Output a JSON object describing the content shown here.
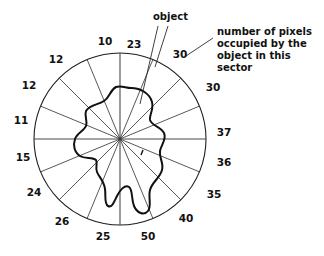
{
  "figure": {
    "title": "",
    "center": {
      "x": 120,
      "y": 139
    },
    "radius": 86,
    "sector_count": 16,
    "object_label": "object",
    "callout": {
      "line1": "number of pixels",
      "line2": "occupied by the",
      "line3": "object in this",
      "line4": "sector"
    }
  },
  "chart_data": {
    "type": "bar",
    "title": "",
    "xlabel": "",
    "ylabel": "number of pixels occupied by the object in this sector",
    "ylim": [
      0,
      50
    ],
    "grid": false,
    "legend": "none",
    "categories": [
      "0-22.5°",
      "22.5-45°",
      "45-67.5°",
      "67.5-90°",
      "90-112.5°",
      "112.5-135°",
      "135-157.5°",
      "157.5-180°",
      "180-202.5°",
      "202.5-225°",
      "225-247.5°",
      "247.5-270°",
      "270-292.5°",
      "292.5-315°",
      "315-337.5°",
      "337.5-360°"
    ],
    "values": [
      23,
      30,
      30,
      37,
      36,
      35,
      40,
      50,
      25,
      26,
      24,
      15,
      11,
      12,
      12,
      10
    ],
    "annotations": [
      "object",
      "number of pixels occupied by the object in this sector"
    ]
  },
  "sectors": [
    {
      "index": 0,
      "value": "23",
      "label_x": 134,
      "label_y": 48,
      "anchor": "middle"
    },
    {
      "index": 1,
      "value": "30",
      "label_x": 180,
      "label_y": 58,
      "anchor": "middle"
    },
    {
      "index": 2,
      "value": "30",
      "label_x": 213,
      "label_y": 91,
      "anchor": "middle"
    },
    {
      "index": 3,
      "value": "37",
      "label_x": 224,
      "label_y": 136,
      "anchor": "middle"
    },
    {
      "index": 4,
      "value": "36",
      "label_x": 224,
      "label_y": 166,
      "anchor": "middle"
    },
    {
      "index": 5,
      "value": "35",
      "label_x": 214,
      "label_y": 198,
      "anchor": "middle"
    },
    {
      "index": 6,
      "value": "40",
      "label_x": 186,
      "label_y": 222,
      "anchor": "middle"
    },
    {
      "index": 7,
      "value": "50",
      "label_x": 148,
      "label_y": 240,
      "anchor": "middle"
    },
    {
      "index": 8,
      "value": "25",
      "label_x": 103,
      "label_y": 240,
      "anchor": "middle"
    },
    {
      "index": 9,
      "value": "26",
      "label_x": 62,
      "label_y": 225,
      "anchor": "middle"
    },
    {
      "index": 10,
      "value": "24",
      "label_x": 34,
      "label_y": 196,
      "anchor": "middle"
    },
    {
      "index": 11,
      "value": "15",
      "label_x": 23,
      "label_y": 161,
      "anchor": "middle"
    },
    {
      "index": 12,
      "value": "11",
      "label_x": 21,
      "label_y": 124,
      "anchor": "middle"
    },
    {
      "index": 13,
      "value": "12",
      "label_x": 29,
      "label_y": 89,
      "anchor": "middle"
    },
    {
      "index": 14,
      "value": "12",
      "label_x": 56,
      "label_y": 63,
      "anchor": "middle"
    },
    {
      "index": 15,
      "value": "10",
      "label_x": 105,
      "label_y": 45,
      "anchor": "middle"
    }
  ]
}
